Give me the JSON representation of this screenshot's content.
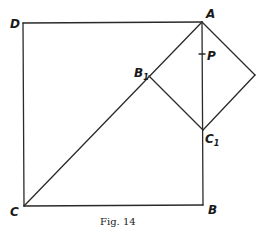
{
  "figure": {
    "caption": "Fig. 14",
    "points": {
      "A": {
        "label": "A",
        "x": 202,
        "y": 22
      },
      "B": {
        "label": "B",
        "x": 203,
        "y": 205
      },
      "C": {
        "label": "C",
        "x": 24,
        "y": 206
      },
      "D": {
        "label": "D",
        "x": 23,
        "y": 23
      },
      "B1": {
        "label": "B",
        "sub": "1",
        "x": 149,
        "y": 76
      },
      "C1": {
        "label": "C",
        "sub": "1",
        "x": 203,
        "y": 130
      },
      "E": {
        "label": "",
        "x": 255,
        "y": 75
      },
      "P": {
        "label": "P",
        "x": 202,
        "y": 54
      }
    },
    "segments": [
      [
        "D",
        "A"
      ],
      [
        "A",
        "B"
      ],
      [
        "B",
        "C"
      ],
      [
        "C",
        "D"
      ],
      [
        "C",
        "A"
      ],
      [
        "A",
        "E"
      ],
      [
        "E",
        "C1"
      ],
      [
        "C1",
        "B1"
      ]
    ]
  }
}
